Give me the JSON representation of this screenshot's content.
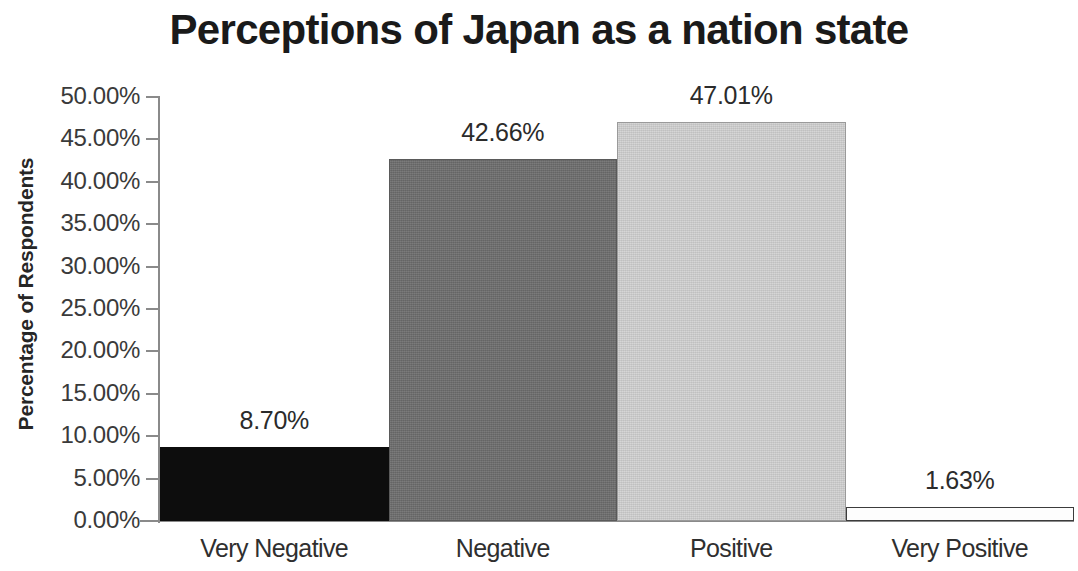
{
  "chart_data": {
    "type": "bar",
    "title": "Perceptions of Japan as a nation state",
    "xlabel": "",
    "ylabel": "Percentage of Respondents",
    "categories": [
      "Very Negative",
      "Negative",
      "Positive",
      "Very Positive"
    ],
    "values": [
      8.7,
      42.66,
      47.01,
      1.63
    ],
    "data_labels": [
      "8.70%",
      "42.66%",
      "47.01%",
      "1.63%"
    ],
    "series": [
      {
        "name": "Percentage of Respondents",
        "values": [
          8.7,
          42.66,
          47.01,
          1.63
        ]
      }
    ],
    "ylim": [
      0,
      50
    ],
    "y_tick_step": 5,
    "y_tick_labels": [
      "50.00%",
      "45.00%",
      "40.00%",
      "35.00%",
      "30.00%",
      "25.00%",
      "20.00%",
      "15.00%",
      "10.00%",
      "5.00%",
      "0.00%"
    ],
    "y_tick_values": [
      50,
      45,
      40,
      35,
      30,
      25,
      20,
      15,
      10,
      5,
      0
    ],
    "grid": false,
    "legend": false,
    "legend_position": "none",
    "bar_colors": [
      "#0d0d0d",
      "#6e6e6e",
      "#d2d2d2",
      "#fdfdfd"
    ],
    "bar_border_colors": [
      "#0d0d0d",
      "#5a5a5a",
      "#9a9a9a",
      "#3c3c3c"
    ],
    "axis_color": "#8a8a8a",
    "text_color": "#2b2b2b",
    "background_color": "#ffffff"
  }
}
